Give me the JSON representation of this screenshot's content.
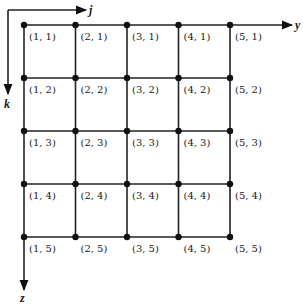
{
  "diagram": {
    "type": "grid-index-diagram",
    "columns": 5,
    "rows": 5,
    "node_x": [
      24,
      75.5,
      127,
      178.5,
      230
    ],
    "node_y": [
      25,
      78,
      131,
      184,
      237
    ],
    "label_format": "(j, k)",
    "nodes": [
      [
        "(1, 1)",
        "(2, 1)",
        "(3, 1)",
        "(4, 1)",
        "(5, 1)"
      ],
      [
        "(1, 2)",
        "(2, 2)",
        "(3, 2)",
        "(4, 2)",
        "(5, 2)"
      ],
      [
        "(1, 3)",
        "(2, 3)",
        "(3, 3)",
        "(4, 3)",
        "(5, 3)"
      ],
      [
        "(1, 4)",
        "(2, 4)",
        "(3, 4)",
        "(4, 4)",
        "(5, 4)"
      ],
      [
        "(1, 5)",
        "(2, 5)",
        "(3, 5)",
        "(4, 5)",
        "(5, 5)"
      ]
    ],
    "axes": {
      "j": {
        "label": "j",
        "direction": "right"
      },
      "k": {
        "label": "k",
        "direction": "down"
      },
      "y": {
        "label": "y",
        "direction": "right"
      },
      "z": {
        "label": "z",
        "direction": "down"
      }
    },
    "colors": {
      "line": "#222222",
      "node": "#111111",
      "background": "#ffffff"
    }
  }
}
